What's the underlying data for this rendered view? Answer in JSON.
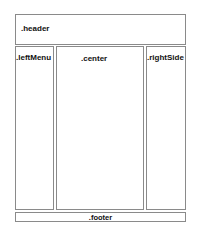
{
  "layout": {
    "header": {
      "label": ".header"
    },
    "left_menu": {
      "label": ".leftMenu"
    },
    "center": {
      "label": ".center"
    },
    "right_side": {
      "label": ".rightSide"
    },
    "footer": {
      "label": ".footer"
    }
  },
  "colors": {
    "border": "#8a8a8a",
    "text": "#111111",
    "background": "#ffffff"
  }
}
